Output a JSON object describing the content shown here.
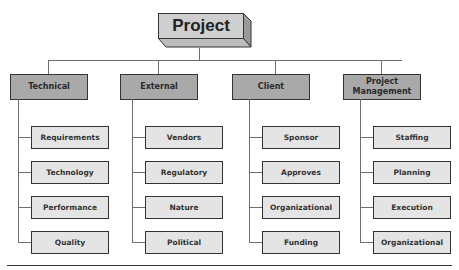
{
  "diagram": {
    "type": "hierarchy-tree",
    "root": {
      "label": "Project"
    },
    "categories": [
      {
        "label": "Technical",
        "children": [
          "Requirements",
          "Technology",
          "Performance",
          "Quality"
        ]
      },
      {
        "label": "External",
        "children": [
          "Vendors",
          "Regulatory",
          "Nature",
          "Political"
        ]
      },
      {
        "label": "Client",
        "children": [
          "Sponsor",
          "Approves",
          "Organizational",
          "Funding"
        ]
      },
      {
        "label": "Project Management",
        "children": [
          "Staffing",
          "Planning",
          "Execution",
          "Organizational"
        ]
      }
    ]
  },
  "colors": {
    "root_fill": "#cfcfcf",
    "root_side": "#9a9a9a",
    "category_fill": "#a9a9a9",
    "child_fill": "#e4e4e4",
    "border": "#333333",
    "connector": "#6e6e6e"
  }
}
